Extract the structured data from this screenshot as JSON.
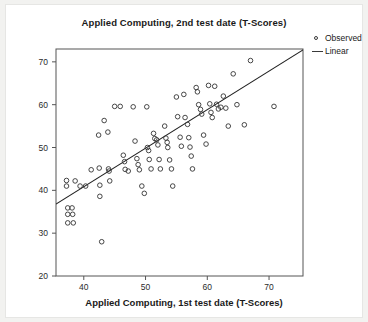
{
  "chart_data": {
    "type": "scatter",
    "title": "Applied Computing, 2nd test date (T-Scores)",
    "xlabel": "Applied Computing, 1st test date (T-Scores)",
    "ylabel": "Applied Computing, 2nd test date (T-Scores)",
    "xlim": [
      35.5,
      75.5
    ],
    "ylim": [
      20,
      73
    ],
    "xticks": [
      40,
      50,
      60,
      70
    ],
    "yticks": [
      20,
      30,
      40,
      50,
      60,
      70
    ],
    "grid": false,
    "legend_position": "right",
    "legend": [
      {
        "label": "Observed",
        "marker": "open-circle"
      },
      {
        "label": "Linear",
        "marker": "line"
      }
    ],
    "series": [
      {
        "name": "Observed",
        "type": "scatter",
        "marker": "open-circle",
        "color": "#333333",
        "points": [
          [
            37.2,
            42.3
          ],
          [
            37.2,
            41.0
          ],
          [
            37.4,
            35.9
          ],
          [
            38.1,
            35.9
          ],
          [
            37.4,
            34.4
          ],
          [
            38.2,
            34.4
          ],
          [
            37.4,
            32.4
          ],
          [
            38.3,
            32.4
          ],
          [
            38.6,
            42.2
          ],
          [
            39.4,
            41.0
          ],
          [
            40.3,
            41.0
          ],
          [
            41.2,
            44.8
          ],
          [
            42.4,
            52.9
          ],
          [
            42.5,
            45.2
          ],
          [
            42.6,
            41.2
          ],
          [
            42.6,
            38.6
          ],
          [
            42.9,
            28.0
          ],
          [
            43.3,
            56.3
          ],
          [
            43.9,
            53.6
          ],
          [
            44.0,
            45.0
          ],
          [
            44.1,
            44.5
          ],
          [
            44.2,
            42.2
          ],
          [
            45.0,
            59.6
          ],
          [
            45.9,
            59.6
          ],
          [
            46.4,
            48.2
          ],
          [
            46.6,
            46.7
          ],
          [
            46.7,
            44.9
          ],
          [
            47.2,
            44.5
          ],
          [
            48.0,
            59.5
          ],
          [
            48.3,
            51.5
          ],
          [
            48.6,
            47.4
          ],
          [
            48.8,
            46.0
          ],
          [
            49.0,
            44.8
          ],
          [
            49.4,
            41.0
          ],
          [
            49.8,
            39.3
          ],
          [
            50.2,
            59.5
          ],
          [
            50.3,
            50.0
          ],
          [
            50.5,
            49.3
          ],
          [
            50.6,
            47.2
          ],
          [
            50.9,
            45.0
          ],
          [
            51.3,
            53.3
          ],
          [
            51.5,
            52.1
          ],
          [
            51.8,
            51.8
          ],
          [
            52.0,
            50.6
          ],
          [
            52.2,
            47.2
          ],
          [
            52.4,
            45.0
          ],
          [
            53.1,
            55.0
          ],
          [
            53.3,
            52.2
          ],
          [
            53.5,
            51.2
          ],
          [
            53.6,
            50.0
          ],
          [
            53.9,
            47.1
          ],
          [
            54.2,
            45.0
          ],
          [
            54.4,
            41.0
          ],
          [
            55.0,
            61.8
          ],
          [
            55.2,
            57.2
          ],
          [
            55.6,
            52.4
          ],
          [
            55.8,
            50.3
          ],
          [
            56.2,
            62.4
          ],
          [
            56.4,
            57.0
          ],
          [
            56.8,
            55.4
          ],
          [
            57.0,
            52.3
          ],
          [
            57.2,
            50.1
          ],
          [
            57.4,
            48.0
          ],
          [
            57.6,
            45.0
          ],
          [
            58.2,
            64.0
          ],
          [
            58.4,
            63.0
          ],
          [
            58.6,
            60.0
          ],
          [
            58.9,
            58.9
          ],
          [
            59.1,
            57.8
          ],
          [
            59.4,
            52.9
          ],
          [
            59.8,
            50.8
          ],
          [
            60.2,
            64.5
          ],
          [
            60.4,
            60.2
          ],
          [
            60.6,
            58.2
          ],
          [
            60.8,
            57.0
          ],
          [
            61.2,
            64.3
          ],
          [
            61.5,
            60.1
          ],
          [
            61.8,
            59.0
          ],
          [
            62.2,
            59.4
          ],
          [
            62.6,
            62.0
          ],
          [
            63.0,
            59.2
          ],
          [
            63.4,
            55.0
          ],
          [
            64.2,
            67.2
          ],
          [
            64.8,
            60.0
          ],
          [
            66.0,
            55.3
          ],
          [
            67.0,
            70.3
          ],
          [
            70.8,
            59.6
          ]
        ]
      },
      {
        "name": "Linear",
        "type": "line",
        "color": "#222222",
        "endpoints": [
          [
            35.5,
            36.8
          ],
          [
            75.5,
            72.8
          ]
        ]
      }
    ]
  }
}
